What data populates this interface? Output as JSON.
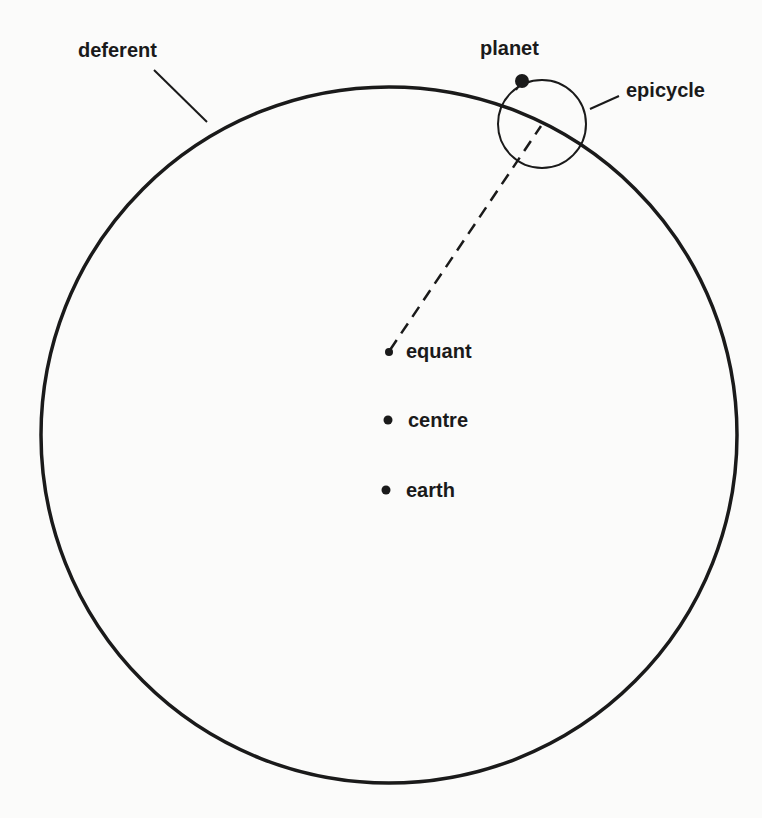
{
  "diagram": {
    "colors": {
      "ink": "#1a1a1a",
      "background": "#fbfbfa"
    },
    "deferent": {
      "label": "deferent",
      "cx": 389,
      "cy": 435,
      "r": 348
    },
    "epicycle": {
      "label": "epicycle",
      "cx": 542,
      "cy": 124,
      "r": 44
    },
    "planet": {
      "label": "planet",
      "cx": 522,
      "cy": 81,
      "r": 7
    },
    "points": [
      {
        "id": "equant",
        "label": "equant",
        "cx": 390,
        "cy": 352
      },
      {
        "id": "centre",
        "label": "centre",
        "cx": 388,
        "cy": 420
      },
      {
        "id": "earth",
        "label": "earth",
        "cx": 386,
        "cy": 490
      }
    ],
    "labels": {
      "deferent": "deferent",
      "planet": "planet",
      "epicycle": "epicycle",
      "equant": "equant",
      "centre": "centre",
      "earth": "earth"
    }
  }
}
